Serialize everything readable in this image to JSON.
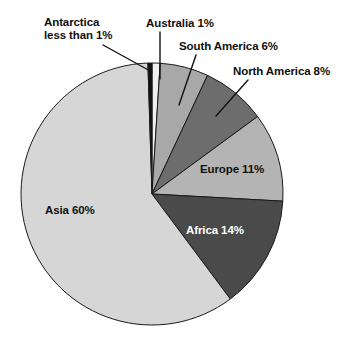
{
  "chart_data": {
    "type": "pie",
    "title": "",
    "subtitle": "",
    "xlabel": "",
    "ylabel": "",
    "legend_position": "none",
    "grid": false,
    "start_angle_deg": 0,
    "direction": "clockwise",
    "units": "percent",
    "categories": [
      "Australia",
      "South America",
      "North America",
      "Europe",
      "Africa",
      "Asia",
      "Antarctica"
    ],
    "values": [
      1,
      6,
      8,
      11,
      14,
      60,
      0.5
    ],
    "slices": [
      {
        "key": "australia",
        "name": "Australia",
        "value": 1,
        "value_text": "1%",
        "label": "Australia 1%",
        "color": "#efefef",
        "label_placement": "external",
        "text_color": "#101010"
      },
      {
        "key": "south-america",
        "name": "South America",
        "value": 6,
        "value_text": "6%",
        "label": "South America 6%",
        "color": "#a8a8a8",
        "label_placement": "external",
        "text_color": "#101010"
      },
      {
        "key": "north-america",
        "name": "North America",
        "value": 8,
        "value_text": "8%",
        "label": "North America 8%",
        "color": "#6d6d6d",
        "label_placement": "external",
        "text_color": "#101010"
      },
      {
        "key": "europe",
        "name": "Europe",
        "value": 11,
        "value_text": "11%",
        "label": "Europe 11%",
        "color": "#b4b4b4",
        "label_placement": "internal",
        "text_color": "#101010"
      },
      {
        "key": "africa",
        "name": "Africa",
        "value": 14,
        "value_text": "14%",
        "label": "Africa 14%",
        "color": "#4a4a4a",
        "label_placement": "internal",
        "text_color": "#ffffff"
      },
      {
        "key": "asia",
        "name": "Asia",
        "value": 60,
        "value_text": "60%",
        "label": "Asia 60%",
        "color": "#d6d6d6",
        "label_placement": "internal",
        "text_color": "#101010"
      },
      {
        "key": "antarctica",
        "name": "Antarctica",
        "value": 0.5,
        "value_text": "less than 1%",
        "label": "Antarctica less than 1%",
        "color": "#111111",
        "label_placement": "external",
        "text_color": "#101010"
      }
    ]
  },
  "labels": {
    "antarctica_line1": "Antarctica",
    "antarctica_line2": "less than 1%",
    "australia": "Australia 1%",
    "south_america": "South America 6%",
    "north_america": "North America 8%",
    "europe": "Europe 11%",
    "africa": "Africa 14%",
    "asia": "Asia 60%"
  },
  "style": {
    "background": "#ffffff",
    "outline": "#1a1a1a",
    "leader_line": "#111111"
  }
}
